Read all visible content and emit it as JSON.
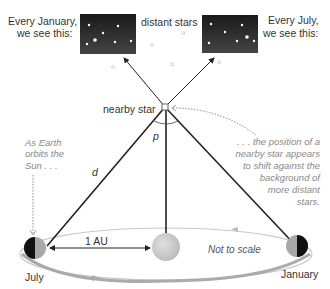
{
  "labels": {
    "every_january_1": "Every January,",
    "every_january_2": "we see this:",
    "distant_stars": "distant stars",
    "every_july_1": "Every July,",
    "every_july_2": "we see this:",
    "nearby_star": "nearby star",
    "parallax_angle": "p",
    "distance": "d",
    "as_earth_1": "As Earth",
    "as_earth_2": "orbits the",
    "as_earth_3": "Sun . . .",
    "position_1": ". . . the position of a",
    "position_2": "nearby star appears",
    "position_3": "to shift against the",
    "position_4": "background of",
    "position_5": "more distant",
    "position_6": "stars.",
    "au": "1 AU",
    "not_to_scale": "Not to scale",
    "july": "July",
    "january": "January"
  },
  "colors": {
    "sky": "#111111",
    "sun": "#cfcfcf",
    "orbit": "#bdbdbd",
    "line": "#222222",
    "annotation": "#888888"
  }
}
